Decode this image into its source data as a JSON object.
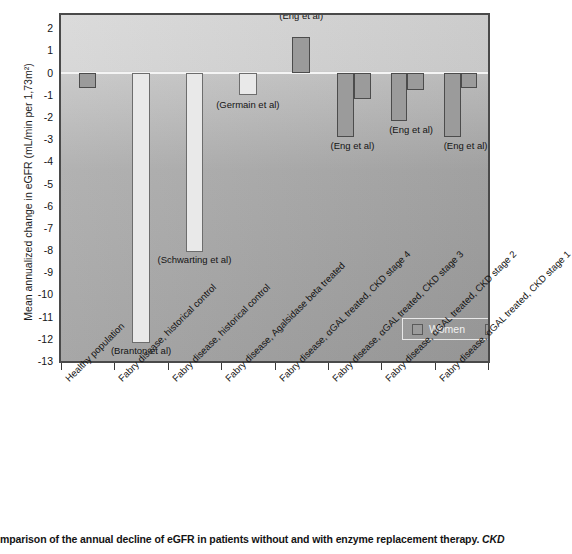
{
  "chart_data": {
    "type": "bar",
    "title": "",
    "xlabel": "",
    "ylabel": "Mean annualized change in eGFR (mL/min per 1,73m²)",
    "ylim": [
      -13,
      2.6
    ],
    "yticks": [
      2,
      1,
      0,
      -1,
      -2,
      -3,
      -4,
      -5,
      -6,
      -7,
      -8,
      -9,
      -10,
      -11,
      -12,
      -13
    ],
    "ytick_labels": [
      "2",
      "1",
      "0",
      "-1",
      "-2",
      "-3",
      "-4",
      "-5",
      "-6",
      "-7",
      "-8",
      "-9",
      "-10",
      "-11",
      "-12",
      "-13"
    ],
    "grid": false,
    "legend_position": "inside-lower-right",
    "legend": [
      {
        "label": "Women",
        "color": "#9b9b9b"
      },
      {
        "label": "Men",
        "color": "#9b9b9b"
      }
    ],
    "categories": [
      "Healthy population",
      "Fabry disease, historical control",
      "Fabry disease, historical control",
      "Fabry disease, Agalsidase beta treated",
      "Fabry disease, αGAL treated, CKD stage 4",
      "Fabry disease, αGAL treated, CKD stage 3",
      "Fabry disease, αGAL treated, CKD stage 2",
      "Fabry disease, αGAL treated, CKD stage 1"
    ],
    "series": [
      {
        "name": "Women",
        "values": [
          -0.7,
          -12.2,
          -8.1,
          -1.0,
          1.6,
          -2.9,
          -2.2,
          -2.9
        ]
      },
      {
        "name": "Men",
        "values": [
          null,
          null,
          null,
          null,
          null,
          -1.2,
          -0.8,
          -0.7
        ]
      }
    ],
    "annotations": [
      {
        "text": "(Branton et al)",
        "category_index": 1
      },
      {
        "text": "(Schwarting et al)",
        "category_index": 2
      },
      {
        "text": "(Germain et al)",
        "category_index": 3
      },
      {
        "text": "(Eng et al)",
        "category_index": 4
      },
      {
        "text": "(Eng et al)",
        "category_index": 5
      },
      {
        "text": "(Eng et al)",
        "category_index": 6
      },
      {
        "text": "(Eng et al)",
        "category_index": 7
      }
    ]
  },
  "caption": {
    "text": "mparison of the annual decline of eGFR in patients without and with enzyme replacement therapy.",
    "italic_tail": " CKD"
  }
}
